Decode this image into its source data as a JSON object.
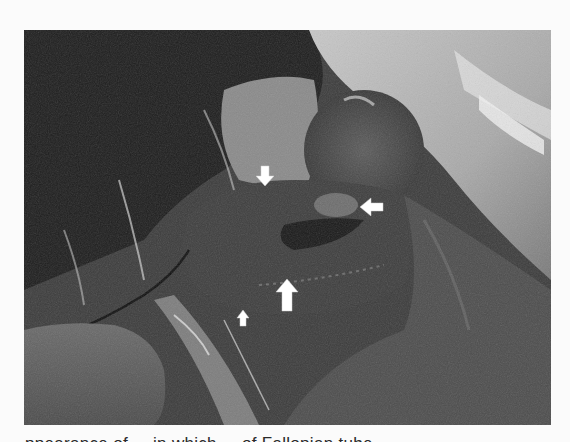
{
  "figure": {
    "palette": {
      "background": "#fbfbfb",
      "dark_region": "#1f1f1f",
      "mid_tissue": "#4a4a4a",
      "drape_light": "#b8b8b8",
      "highlight": "#e8e8e8",
      "arrow": "#ffffff"
    },
    "arrows": [
      {
        "name": "arrow-down",
        "direction": "down",
        "size": "small"
      },
      {
        "name": "arrow-left",
        "direction": "left",
        "size": "small"
      },
      {
        "name": "arrow-up-large",
        "direction": "up",
        "size": "large"
      },
      {
        "name": "arrow-up-small",
        "direction": "up",
        "size": "small"
      }
    ]
  },
  "caption": {
    "text": "...ppearance of ... in which ... of Fallopian tube ..."
  }
}
